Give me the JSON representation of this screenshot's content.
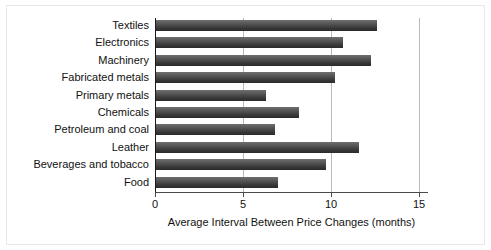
{
  "chart_data": {
    "type": "bar",
    "orientation": "horizontal",
    "title": "",
    "xlabel": "Average Interval Between Price Changes (months)",
    "ylabel": "",
    "xlim": [
      0,
      15.5
    ],
    "xticks": [
      0,
      5,
      10,
      15
    ],
    "xticklabels": [
      "0",
      "5",
      "10",
      "15"
    ],
    "grid": "vertical",
    "legend": "none",
    "categories": [
      "Textiles",
      "Electronics",
      "Machinery",
      "Fabricated metals",
      "Primary metals",
      "Chemicals",
      "Petroleum and coal",
      "Leather",
      "Beverages and tobacco",
      "Food"
    ],
    "values": [
      12.6,
      10.7,
      12.3,
      10.2,
      6.3,
      8.2,
      6.8,
      11.6,
      9.7,
      7.0
    ],
    "bar_color_light": "#6f6f6f",
    "bar_color_dark": "#2a2a2a",
    "axis_color": "#1a1a1a",
    "grid_color": "#b9b9b9"
  }
}
